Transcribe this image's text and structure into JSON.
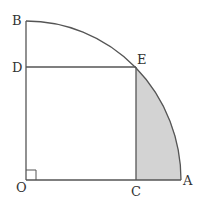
{
  "diagram": {
    "type": "geometry",
    "points": {
      "O": {
        "label": "O",
        "x": 26,
        "y": 180
      },
      "A": {
        "label": "A",
        "x": 181,
        "y": 180
      },
      "B": {
        "label": "B",
        "x": 26,
        "y": 21
      },
      "C": {
        "label": "C",
        "x": 136,
        "y": 180
      },
      "D": {
        "label": "D",
        "x": 26,
        "y": 67
      },
      "E": {
        "label": "E",
        "x": 136,
        "y": 67
      }
    },
    "right_angle_at": "O",
    "shaded_region": "region C-E-A (between segment EC, segment CA and arc EA)",
    "colors": {
      "stroke": "#555555",
      "shade": "#d3d3d3",
      "background": "#ffffff"
    }
  }
}
